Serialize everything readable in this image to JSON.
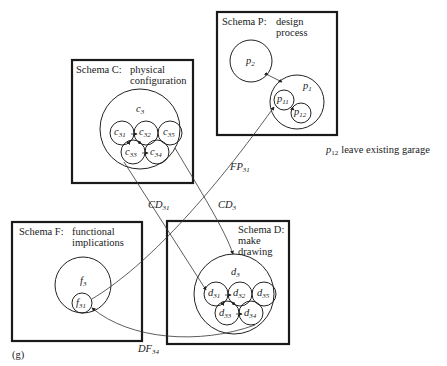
{
  "figure_label": "(g)",
  "schemas": {
    "C": {
      "title": "Schema C:",
      "title_var": "C",
      "desc_line1": "physical",
      "desc_line2": "configuration",
      "outer": "c",
      "outer_sub": "3",
      "nodes": [
        {
          "base": "c",
          "sub": "31"
        },
        {
          "base": "c",
          "sub": "32"
        },
        {
          "base": "c",
          "sub": "35"
        },
        {
          "base": "c",
          "sub": "33"
        },
        {
          "base": "c",
          "sub": "34"
        }
      ]
    },
    "P": {
      "title": "Schema P:",
      "title_var": "P",
      "desc_line1": "design",
      "desc_line2": "process",
      "node_p2": {
        "base": "p",
        "sub": "2"
      },
      "node_p1": {
        "base": "p",
        "sub": "1"
      },
      "node_p11": {
        "base": "p",
        "sub": "11"
      },
      "node_p12": {
        "base": "p",
        "sub": "12"
      }
    },
    "F": {
      "title": "Schema F:",
      "title_var": "F",
      "desc_line1": "functional",
      "desc_line2": "implications",
      "outer": {
        "base": "f",
        "sub": "3"
      },
      "inner": {
        "base": "f",
        "sub": "31"
      }
    },
    "D": {
      "title": "Schema D:",
      "title_var": "D",
      "desc_line1": "make",
      "desc_line2": "drawing",
      "outer": {
        "base": "d",
        "sub": "3"
      },
      "nodes": [
        {
          "base": "d",
          "sub": "31"
        },
        {
          "base": "d",
          "sub": "32"
        },
        {
          "base": "d",
          "sub": "35"
        },
        {
          "base": "d",
          "sub": "33"
        },
        {
          "base": "d",
          "sub": "34"
        }
      ]
    }
  },
  "links": [
    {
      "name": "FP31",
      "base": "FP",
      "sub": "31"
    },
    {
      "name": "CD31",
      "base": "CD",
      "sub": "31"
    },
    {
      "name": "CD3",
      "base": "CD",
      "sub": "3"
    },
    {
      "name": "DF34",
      "base": "DF",
      "sub": "34"
    }
  ],
  "annotation": {
    "base": "p",
    "sub": "12",
    "text": "leave existing garage"
  }
}
